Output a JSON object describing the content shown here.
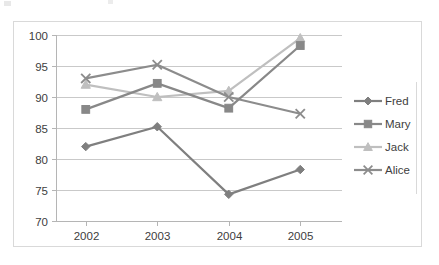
{
  "chart_data": {
    "type": "line",
    "title": "",
    "subtitle": "",
    "xlabel": "",
    "ylabel": "",
    "categories": [
      "2002",
      "2003",
      "2004",
      "2005"
    ],
    "x_tick_labels": [
      "2002",
      "2003",
      "2004",
      "2005"
    ],
    "y_tick_labels": [
      "70",
      "75",
      "80",
      "85",
      "90",
      "95",
      "100"
    ],
    "y_ticks": [
      70,
      75,
      80,
      85,
      90,
      95,
      100
    ],
    "ylim": [
      70,
      100
    ],
    "grid": "horizontal",
    "legend_position": "right",
    "series": [
      {
        "name": "Fred",
        "marker": "diamond",
        "color": "#7f7f7f",
        "values": [
          82.0,
          85.2,
          74.3,
          78.3
        ]
      },
      {
        "name": "Mary",
        "marker": "square",
        "color": "#888888",
        "values": [
          88.0,
          92.2,
          88.2,
          98.3
        ]
      },
      {
        "name": "Jack",
        "marker": "triangle",
        "color": "#bfbfbf",
        "values": [
          92.0,
          90.0,
          91.0,
          99.5
        ]
      },
      {
        "name": "Alice",
        "marker": "cross",
        "color": "#8c8c8c",
        "values": [
          93.0,
          95.2,
          90.0,
          87.3
        ]
      }
    ]
  },
  "legend": {
    "entries": [
      {
        "label": "Fred"
      },
      {
        "label": "Mary"
      },
      {
        "label": "Jack"
      },
      {
        "label": "Alice"
      }
    ]
  },
  "colors": {
    "gridline": "#c9c9c9",
    "axis": "#b5b5b5",
    "frame_border": "#d9d9d9",
    "text": "#404040",
    "background": "#ffffff"
  }
}
